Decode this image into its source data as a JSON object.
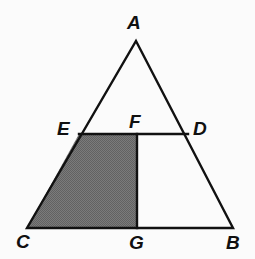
{
  "figure": {
    "kind": "euclidean-geometry-diagram",
    "background_color": "#fbfbfb",
    "stroke_color": "#111111",
    "stroke_width": 2.4,
    "shaded_fill_color": "#6f6f6f",
    "shaded_region_name": "CEFG"
  },
  "points": {
    "A": {
      "label": "A",
      "x": 136,
      "y": 41
    },
    "B": {
      "label": "B",
      "x": 233,
      "y": 228
    },
    "C": {
      "label": "C",
      "x": 27,
      "y": 228
    },
    "D": {
      "label": "D",
      "x": 188,
      "y": 134
    },
    "E": {
      "label": "E",
      "x": 79,
      "y": 134
    },
    "F": {
      "label": "F",
      "x": 137,
      "y": 134
    },
    "G": {
      "label": "G",
      "x": 137,
      "y": 228
    }
  },
  "segments": [
    {
      "name": "AC",
      "from": "A",
      "to": "C"
    },
    {
      "name": "AB",
      "from": "A",
      "to": "B"
    },
    {
      "name": "CB",
      "from": "C",
      "to": "B"
    },
    {
      "name": "ED",
      "from": "E",
      "to": "D"
    },
    {
      "name": "FG",
      "from": "F",
      "to": "G"
    }
  ],
  "paths": {
    "triangle_ABC": "M 136,41 L 233,228 L 27,228 Z",
    "segment_ED": "M 79,134 L 188,134",
    "segment_FG": "M 137,134 L 137,228",
    "shaded_trapezoid_CEFG": "M 79,134 L 137,134 L 137,228 L 27,228 Z"
  },
  "labels": {
    "A": "A",
    "B": "B",
    "C": "C",
    "D": "D",
    "E": "E",
    "F": "F",
    "G": "G"
  }
}
